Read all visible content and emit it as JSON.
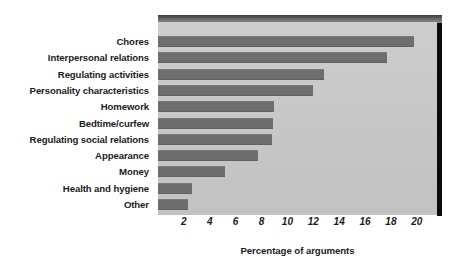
{
  "chart_data": {
    "type": "bar",
    "orientation": "horizontal",
    "title": "",
    "xlabel": "Percentage of arguments",
    "ylabel": "",
    "categories": [
      "Chores",
      "Interpersonal relations",
      "Regulating activities",
      "Personality characteristics",
      "Homework",
      "Bedtime/curfew",
      "Regulating social relations",
      "Appearance",
      "Money",
      "Health and hygiene",
      "Other"
    ],
    "values": [
      19.8,
      17.7,
      12.8,
      12.0,
      9.0,
      8.9,
      8.8,
      7.7,
      5.2,
      2.6,
      2.3
    ],
    "xlim": [
      0,
      21.5
    ],
    "xticks": [
      2,
      4,
      6,
      8,
      10,
      12,
      14,
      16,
      18,
      20
    ],
    "xtick_labels": [
      "2",
      "4",
      "6",
      "8",
      "10",
      "12",
      "14",
      "16",
      "18",
      "20"
    ],
    "grid": false,
    "legend": null,
    "bar_color": "#6e6e6e",
    "plot_background": "#c9c9c9",
    "figure_background": "#ffffff",
    "shadow_color": "#0c0c0c",
    "bevel_color": "#6d6d6d",
    "text_color": "#1b1b1b"
  }
}
